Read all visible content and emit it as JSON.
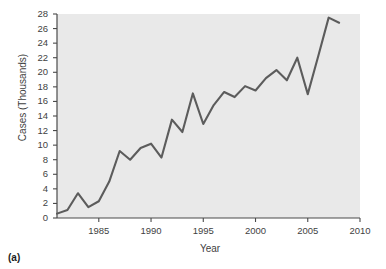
{
  "figure": {
    "panel_label": "(a)",
    "line_color": "#5c5c5c",
    "plot_background": "#e9e9e9",
    "axis_color": "#4a4a4a"
  },
  "chart_data": {
    "type": "line",
    "title": "",
    "xlabel": "Year",
    "ylabel": "Cases (Thousands)",
    "xlim": [
      1981,
      2010
    ],
    "ylim": [
      0,
      28
    ],
    "grid": false,
    "legend": null,
    "x_ticks": [
      1985,
      1990,
      1995,
      2000,
      2005,
      2010
    ],
    "x_tick_labels": [
      "1985",
      "1990",
      "1995",
      "2000",
      "2005",
      "2010"
    ],
    "y_ticks": [
      0,
      2,
      4,
      6,
      8,
      10,
      12,
      14,
      16,
      18,
      20,
      22,
      24,
      26,
      28
    ],
    "y_tick_labels": [
      "0",
      "2",
      "4",
      "6",
      "8",
      "10",
      "12",
      "14",
      "16",
      "18",
      "20",
      "22",
      "24",
      "26",
      "28"
    ],
    "x": [
      1981,
      1982,
      1983,
      1984,
      1985,
      1986,
      1987,
      1988,
      1989,
      1990,
      1991,
      1992,
      1993,
      1994,
      1995,
      1996,
      1997,
      1998,
      1999,
      2000,
      2001,
      2002,
      2003,
      2004,
      2005,
      2006,
      2007,
      2008
    ],
    "values": [
      0.6,
      1.1,
      3.4,
      1.5,
      2.3,
      5.0,
      9.2,
      8.0,
      9.6,
      10.2,
      8.3,
      13.5,
      11.8,
      17.1,
      12.9,
      15.5,
      17.3,
      16.6,
      18.1,
      17.5,
      19.2,
      20.3,
      18.9,
      22.0,
      17.0,
      22.2,
      27.5,
      26.8
    ],
    "series": [
      {
        "name": "Cases",
        "values": [
          0.6,
          1.1,
          3.4,
          1.5,
          2.3,
          5.0,
          9.2,
          8.0,
          9.6,
          10.2,
          8.3,
          13.5,
          11.8,
          17.1,
          12.9,
          15.5,
          17.3,
          16.6,
          18.1,
          17.5,
          19.2,
          20.3,
          18.9,
          22.0,
          17.0,
          22.2,
          27.5,
          26.8
        ]
      }
    ]
  }
}
